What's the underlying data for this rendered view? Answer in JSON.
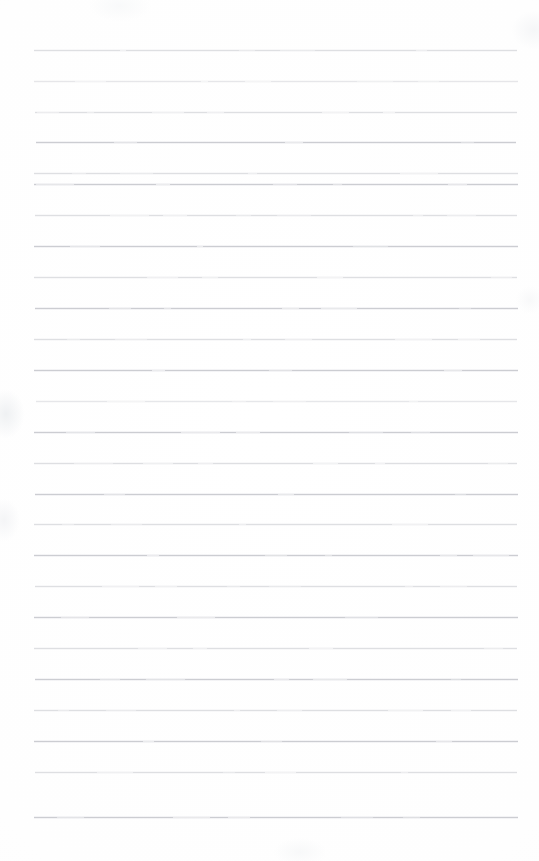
{
  "document": {
    "kind": "scanned-ruled-notepad-page",
    "title": "Blank ruled notepad page",
    "orientation": "portrait",
    "page_width": 539,
    "page_height": 861,
    "text_content": "",
    "handwriting_present": "no",
    "printed_text_present": "no"
  },
  "paper": {
    "background_color": "#fefefe",
    "edge_tint_color": "#f4f5f6",
    "margin_left": 34,
    "margin_right": 21,
    "margin_top": 50,
    "margin_bottom": 44
  },
  "ruling": {
    "style": "horizontal-ruled",
    "line_color": "#b9bcc2",
    "line_thickness": 1,
    "line_count": 26,
    "line_spacing": 30.7,
    "line_start_x": 34,
    "line_end_x": 518,
    "first_line_y": 50,
    "last_line_y": 817,
    "vertical_margin_rule": "none",
    "lines": [
      {
        "index": 1,
        "y": 50,
        "x1": 34,
        "x2": 517,
        "tone": "faded"
      },
      {
        "index": 2,
        "y": 81,
        "x1": 34,
        "x2": 518,
        "tone": "lighter"
      },
      {
        "index": 3,
        "y": 112,
        "x1": 35,
        "x2": 517,
        "tone": "faded"
      },
      {
        "index": 4,
        "y": 142,
        "x1": 36,
        "x2": 516,
        "tone": "normal"
      },
      {
        "index": 5,
        "y": 173,
        "x1": 34,
        "x2": 518,
        "tone": "faded"
      },
      {
        "index": 6,
        "y": 184,
        "x1": 34,
        "x2": 518,
        "tone": "normal"
      },
      {
        "index": 7,
        "y": 215,
        "x1": 35,
        "x2": 517,
        "tone": "faded"
      },
      {
        "index": 8,
        "y": 246,
        "x1": 34,
        "x2": 518,
        "tone": "normal"
      },
      {
        "index": 9,
        "y": 277,
        "x1": 34,
        "x2": 517,
        "tone": "faded"
      },
      {
        "index": 10,
        "y": 308,
        "x1": 35,
        "x2": 518,
        "tone": "normal"
      },
      {
        "index": 11,
        "y": 339,
        "x1": 34,
        "x2": 517,
        "tone": "faded"
      },
      {
        "index": 12,
        "y": 370,
        "x1": 34,
        "x2": 518,
        "tone": "normal"
      },
      {
        "index": 13,
        "y": 401,
        "x1": 36,
        "x2": 517,
        "tone": "lighter"
      },
      {
        "index": 14,
        "y": 432,
        "x1": 34,
        "x2": 518,
        "tone": "normal"
      },
      {
        "index": 15,
        "y": 463,
        "x1": 34,
        "x2": 517,
        "tone": "faded"
      },
      {
        "index": 16,
        "y": 494,
        "x1": 35,
        "x2": 518,
        "tone": "normal"
      },
      {
        "index": 17,
        "y": 524,
        "x1": 34,
        "x2": 517,
        "tone": "faded"
      },
      {
        "index": 18,
        "y": 555,
        "x1": 34,
        "x2": 518,
        "tone": "normal"
      },
      {
        "index": 19,
        "y": 586,
        "x1": 35,
        "x2": 517,
        "tone": "faded"
      },
      {
        "index": 20,
        "y": 617,
        "x1": 34,
        "x2": 518,
        "tone": "normal"
      },
      {
        "index": 21,
        "y": 648,
        "x1": 34,
        "x2": 517,
        "tone": "faded"
      },
      {
        "index": 22,
        "y": 679,
        "x1": 35,
        "x2": 518,
        "tone": "normal"
      },
      {
        "index": 23,
        "y": 710,
        "x1": 34,
        "x2": 517,
        "tone": "faded"
      },
      {
        "index": 24,
        "y": 741,
        "x1": 34,
        "x2": 518,
        "tone": "normal"
      },
      {
        "index": 25,
        "y": 772,
        "x1": 35,
        "x2": 517,
        "tone": "faded"
      },
      {
        "index": 26,
        "y": 817,
        "x1": 34,
        "x2": 518,
        "tone": "normal"
      }
    ]
  }
}
